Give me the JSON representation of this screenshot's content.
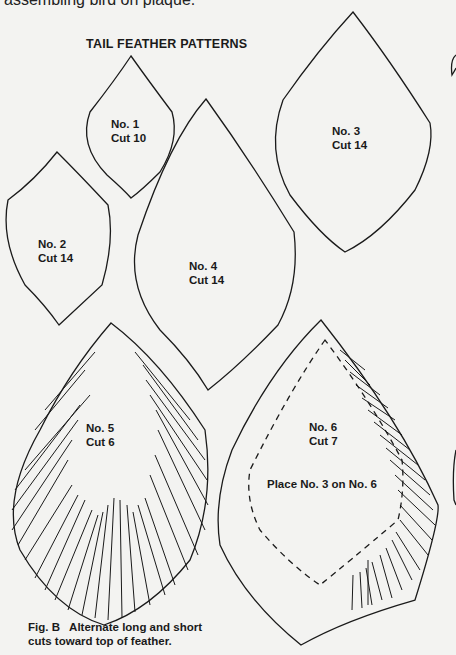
{
  "page": {
    "top_text": "assembling bird on plaque.",
    "title": "TAIL FEATHER PATTERNS",
    "patterns": [
      {
        "number": "No. 1",
        "cut": "Cut 10"
      },
      {
        "number": "No. 2",
        "cut": "Cut 14"
      },
      {
        "number": "No. 3",
        "cut": "Cut 14"
      },
      {
        "number": "No. 4",
        "cut": "Cut 14"
      },
      {
        "number": "No. 5",
        "cut": "Cut 6"
      },
      {
        "number": "No. 6",
        "cut": "Cut 7",
        "note": "Place No. 3 on No. 6"
      }
    ],
    "caption": {
      "line1": "Fig. B   Alternate long and short",
      "line2": "cuts toward top of feather."
    },
    "colors": {
      "paper": "#f3f3f1",
      "ink": "#1a1a1a"
    }
  }
}
